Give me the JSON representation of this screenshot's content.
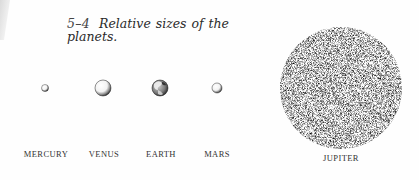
{
  "figure": {
    "number": "5–4",
    "caption": "Relative sizes of the planets."
  },
  "planets": [
    {
      "name": "MERCURY",
      "cx": 45,
      "cy": 88,
      "r": 3.5,
      "label_x": 46,
      "style": "shaded-sphere"
    },
    {
      "name": "VENUS",
      "cx": 103,
      "cy": 88,
      "r": 8,
      "label_x": 104,
      "style": "shaded-sphere"
    },
    {
      "name": "EARTH",
      "cx": 160,
      "cy": 88,
      "r": 8,
      "label_x": 161,
      "style": "continents"
    },
    {
      "name": "MARS",
      "cx": 217,
      "cy": 88,
      "r": 5,
      "label_x": 217,
      "style": "shaded-sphere"
    },
    {
      "name": "JUPITER",
      "cx": 341,
      "cy": 88,
      "r": 61,
      "label_x": 341,
      "style": "banded-stipple"
    }
  ],
  "colors": {
    "ink": "#1a1a1a",
    "paper": "#fefefe",
    "label": "#333333"
  }
}
